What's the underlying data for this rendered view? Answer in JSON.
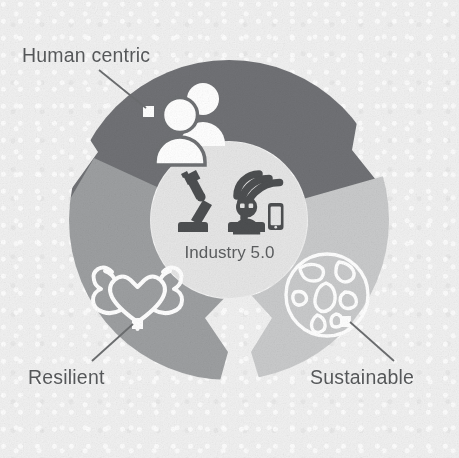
{
  "figure": {
    "type": "cycle-donut-diagram",
    "title_center": "Industry 5.0",
    "background_color": "#f1f1f1",
    "text_color": "#555759"
  },
  "center": {
    "label": "Industry 5.0",
    "fill_color": "#e6e6e6",
    "icons": [
      {
        "name": "robotic-arm-icon",
        "color": "#4d4f51"
      },
      {
        "name": "robot-head-icon",
        "color": "#4d4f51"
      },
      {
        "name": "wifi-signal-icon",
        "color": "#4d4f51"
      },
      {
        "name": "smartphone-icon",
        "color": "#4d4f51"
      }
    ]
  },
  "segments": [
    {
      "id": "human-centric",
      "label": "Human centric",
      "color": "#6f7174",
      "icon": "two-people-icon",
      "icon_color": "#ffffff",
      "marker_color": "#ffffff",
      "position": "top"
    },
    {
      "id": "resilient",
      "label": "Resilient",
      "color": "#9d9fa1",
      "icon": "heart-with-flexed-biceps-icon",
      "icon_color": "#ffffff",
      "marker_color": "#ffffff",
      "position": "bottom-left"
    },
    {
      "id": "sustainable",
      "label": "Sustainable",
      "color": "#c9cacb",
      "icon": "globe-earth-icon",
      "icon_color": "#ffffff",
      "marker_color": "#ffffff",
      "position": "right"
    }
  ],
  "leader_lines": [
    {
      "name": "leader-line-human-centric",
      "color": "#6c6e70"
    },
    {
      "name": "leader-line-resilient",
      "color": "#6c6e70"
    },
    {
      "name": "leader-line-sustainable",
      "color": "#6c6e70"
    }
  ]
}
